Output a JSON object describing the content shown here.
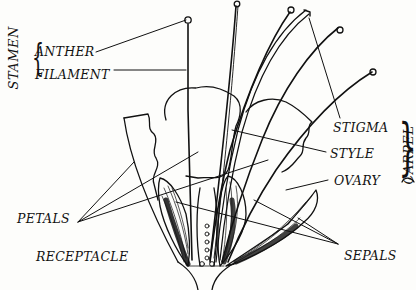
{
  "diagram": {
    "groups": {
      "stamen": "STAMEN",
      "carpel": "CARPEL"
    },
    "labels": {
      "anther": "ANTHER",
      "filament": "FILAMENT",
      "stigma": "STIGMA",
      "style": "STYLE",
      "ovary": "OVARY",
      "petals": "PETALS",
      "receptacle": "RECEPTACLE",
      "sepals": "SEPALS"
    },
    "colors": {
      "ink": "#111111",
      "paper": "#fdfdfb"
    }
  }
}
